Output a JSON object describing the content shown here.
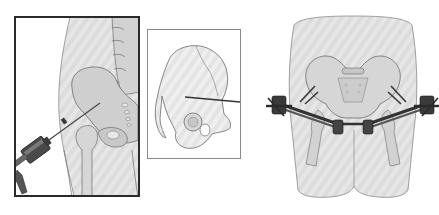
{
  "figure": {
    "background": "#ffffff",
    "panels": [
      {
        "id": "left",
        "description": "Lateral view of hip with pin being inserted by a hand drill",
        "frame": {
          "x": 14,
          "y": 16,
          "w": 126,
          "h": 181,
          "stroke": "#2a2a2a",
          "stroke_width": 2
        }
      },
      {
        "id": "middle",
        "description": "Hemipelvis (innominate bone) showing pin trajectory into iliac crest",
        "frame": {
          "x": 147,
          "y": 29,
          "w": 94,
          "h": 130,
          "stroke": "#8a8a8a",
          "stroke_width": 1
        }
      },
      {
        "id": "right",
        "description": "Anterior view of pelvis with external fixator frame applied",
        "frame": null
      }
    ],
    "colors": {
      "skin": "#e4e4e4",
      "skin_light": "#f0f0f0",
      "bone": "#cfcfcf",
      "bone_outline": "#6e6e6e",
      "metal_dark": "#3a3a3a",
      "metal_mid": "#5a5a5a",
      "frame_dark": "#2a2a2a"
    }
  }
}
